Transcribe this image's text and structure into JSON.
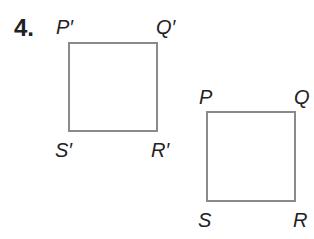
{
  "problem": {
    "number": "4.",
    "image_square": {
      "labels": {
        "P": "P′",
        "Q": "Q′",
        "R": "R′",
        "S": "S′"
      }
    },
    "original_square": {
      "labels": {
        "P": "P",
        "Q": "Q",
        "R": "R",
        "S": "S"
      }
    },
    "stroke_color": "#8a8a8a"
  }
}
